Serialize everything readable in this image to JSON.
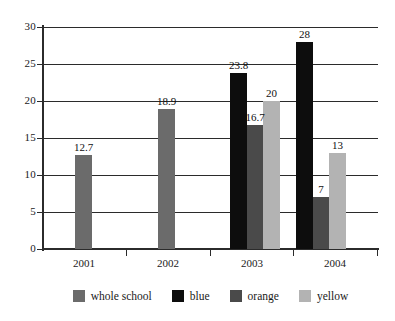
{
  "chart_data": {
    "type": "bar",
    "title": "",
    "subtitle": "",
    "xlabel": "",
    "ylabel": "",
    "categories": [
      "2001",
      "2002",
      "2003",
      "2004"
    ],
    "ylim": [
      0,
      30
    ],
    "yticks": [
      0,
      5,
      10,
      15,
      20,
      25,
      30
    ],
    "ytick_labels": [
      "0",
      "5",
      "10",
      "15",
      "20",
      "25",
      "30"
    ],
    "grid": true,
    "legend_position": "bottom",
    "series": [
      {
        "name": "whole school",
        "color": "#6b6b6b",
        "values": [
          12.7,
          18.9,
          null,
          null
        ],
        "value_labels": [
          "12.7",
          "18.9",
          "",
          ""
        ]
      },
      {
        "name": "blue",
        "color": "#0d0d0d",
        "values": [
          null,
          null,
          23.8,
          28
        ],
        "value_labels": [
          "",
          "",
          "23.8",
          "28"
        ]
      },
      {
        "name": "orange",
        "color": "#4a4a4a",
        "values": [
          null,
          null,
          16.7,
          7
        ],
        "value_labels": [
          "",
          "",
          "16.7",
          "7"
        ]
      },
      {
        "name": "yellow",
        "color": "#b3b3b3",
        "values": [
          null,
          null,
          20,
          13
        ],
        "value_labels": [
          "",
          "",
          "20",
          "13"
        ]
      }
    ],
    "data_labels": [
      "12.7",
      "18.9",
      "23.8",
      "16.7",
      "20",
      "28",
      "7",
      "13"
    ]
  },
  "axes": {
    "y_ticks": [
      {
        "label": "30",
        "value": 30
      },
      {
        "label": "25",
        "value": 25
      },
      {
        "label": "20",
        "value": 20
      },
      {
        "label": "15",
        "value": 15
      },
      {
        "label": "10",
        "value": 10
      },
      {
        "label": "5",
        "value": 5
      },
      {
        "label": "0",
        "value": 0
      }
    ],
    "x_ticks": [
      {
        "label": "2001"
      },
      {
        "label": "2002"
      },
      {
        "label": "2003"
      },
      {
        "label": "2004"
      }
    ]
  },
  "legend": {
    "items": [
      {
        "label": "whole school",
        "color": "#6b6b6b"
      },
      {
        "label": "blue",
        "color": "#0d0d0d"
      },
      {
        "label": "orange",
        "color": "#4a4a4a"
      },
      {
        "label": "yellow",
        "color": "#b3b3b3"
      }
    ]
  },
  "bars": [
    {
      "group": "2001",
      "series": "whole school",
      "value": 12.7,
      "label": "12.7",
      "color": "#6b6b6b",
      "x": 75,
      "width": 17
    },
    {
      "group": "2002",
      "series": "whole school",
      "value": 18.9,
      "label": "18.9",
      "color": "#6b6b6b",
      "x": 158,
      "width": 17
    },
    {
      "group": "2003",
      "series": "blue",
      "value": 23.8,
      "label": "23.8",
      "color": "#0d0d0d",
      "x": 230,
      "width": 17
    },
    {
      "group": "2003",
      "series": "orange",
      "value": 16.7,
      "label": "16.7",
      "color": "#4a4a4a",
      "x": 247,
      "width": 16
    },
    {
      "group": "2003",
      "series": "yellow",
      "value": 20,
      "label": "20",
      "color": "#b3b3b3",
      "x": 263,
      "width": 17
    },
    {
      "group": "2004",
      "series": "blue",
      "value": 28,
      "label": "28",
      "color": "#0d0d0d",
      "x": 296,
      "width": 17
    },
    {
      "group": "2004",
      "series": "orange",
      "value": 7,
      "label": "7",
      "color": "#4a4a4a",
      "x": 313,
      "width": 16
    },
    {
      "group": "2004",
      "series": "yellow",
      "value": 13,
      "label": "13",
      "color": "#b3b3b3",
      "x": 329,
      "width": 17
    }
  ],
  "group_tick_x": [
    126,
    210,
    293,
    377
  ]
}
